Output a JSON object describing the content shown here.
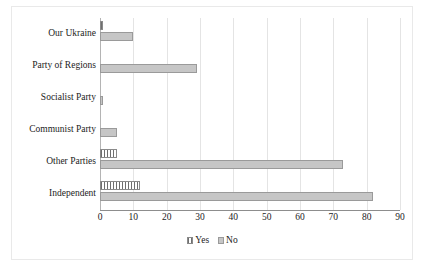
{
  "chart_data": {
    "type": "bar",
    "orientation": "horizontal",
    "title": "",
    "subtitle": "",
    "xlabel": "",
    "ylabel": "",
    "xlim": [
      0,
      90
    ],
    "xticks": [
      0,
      10,
      20,
      30,
      40,
      50,
      60,
      70,
      80,
      90
    ],
    "xtick_labels": [
      "0",
      "10",
      "20",
      "30",
      "40",
      "50",
      "60",
      "70",
      "80",
      "90"
    ],
    "grid": true,
    "grid_axis": "x",
    "legend_position": "bottom",
    "categories": [
      "Our Ukraine",
      "Party of Regions",
      "Socialist Party",
      "Communist Party",
      "Other Parties",
      "Independent"
    ],
    "series": [
      {
        "name": "Yes",
        "color": "#6f6f6f",
        "pattern": "vertical-stripes",
        "values": [
          1,
          0,
          0,
          0,
          5,
          12
        ]
      },
      {
        "name": "No",
        "color": "#c6c6c6",
        "pattern": "solid",
        "values": [
          10,
          29,
          1,
          5,
          73,
          82
        ]
      }
    ],
    "annotations": []
  },
  "legend": {
    "items": [
      {
        "label": "Yes",
        "swatch": "yes"
      },
      {
        "label": "No",
        "swatch": "no"
      }
    ]
  },
  "colors": {
    "yes": "#6f6f6f",
    "no": "#c6c6c6",
    "gridline": "#e4e4e4",
    "axis": "#8d8d8d",
    "text": "#1c1c1c",
    "background": "#ffffff"
  }
}
